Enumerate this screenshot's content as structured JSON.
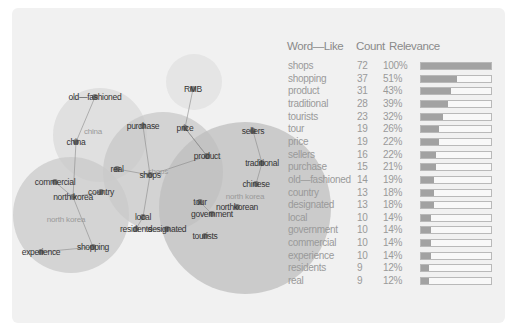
{
  "diagram": {
    "clusters": [
      {
        "id": "china",
        "label": "china",
        "cx": 100,
        "cy": 135,
        "r": 47,
        "color": "#d9d9d9",
        "label_x": 93,
        "label_y": 134
      },
      {
        "id": "rmb",
        "label": "",
        "cx": 194,
        "cy": 82,
        "r": 28,
        "color": "#e0e0e0",
        "label_x": 0,
        "label_y": 0
      },
      {
        "id": "shops",
        "label": "shops",
        "cx": 163,
        "cy": 172,
        "r": 60,
        "color": "#c8c8c8",
        "label_x": 158,
        "label_y": 174
      },
      {
        "id": "north-korea",
        "label": "north korea",
        "cx": 71,
        "cy": 215,
        "r": 58,
        "color": "#c9c9c9",
        "label_x": 66,
        "label_y": 222
      },
      {
        "id": "north-korea-2",
        "label": "north korea",
        "cx": 245,
        "cy": 208,
        "r": 86,
        "color": "#bebebe",
        "label_x": 245,
        "label_y": 199
      }
    ],
    "nodes": [
      {
        "id": "old-fashioned",
        "label": "old—fashioned",
        "x": 95,
        "y": 97
      },
      {
        "id": "china",
        "label": "china",
        "x": 76,
        "y": 142
      },
      {
        "id": "rmb",
        "label": "RMB",
        "x": 193,
        "y": 89
      },
      {
        "id": "purchase",
        "label": "purchase",
        "x": 143,
        "y": 126
      },
      {
        "id": "price",
        "label": "price",
        "x": 185,
        "y": 128
      },
      {
        "id": "product",
        "label": "product",
        "x": 207,
        "y": 156
      },
      {
        "id": "sellers",
        "label": "sellers",
        "x": 253,
        "y": 131
      },
      {
        "id": "traditional",
        "label": "traditional",
        "x": 262,
        "y": 163
      },
      {
        "id": "real",
        "label": "real",
        "x": 117,
        "y": 169
      },
      {
        "id": "shops",
        "label": "shops",
        "x": 150,
        "y": 175
      },
      {
        "id": "commercial",
        "label": "commercial",
        "x": 55,
        "y": 182
      },
      {
        "id": "north-korea",
        "label": "north korea",
        "x": 73,
        "y": 197
      },
      {
        "id": "country",
        "label": "country",
        "x": 101,
        "y": 192
      },
      {
        "id": "chinese",
        "label": "chinese",
        "x": 256,
        "y": 184
      },
      {
        "id": "tour",
        "label": "tour",
        "x": 200,
        "y": 202
      },
      {
        "id": "north-korean",
        "label": "northkorean",
        "x": 237,
        "y": 207
      },
      {
        "id": "government",
        "label": "government",
        "x": 212,
        "y": 214
      },
      {
        "id": "local",
        "label": "local",
        "x": 143,
        "y": 217
      },
      {
        "id": "residents",
        "label": "residents",
        "x": 136,
        "y": 229
      },
      {
        "id": "designated",
        "label": "designated",
        "x": 167,
        "y": 229
      },
      {
        "id": "tourists",
        "label": "tourists",
        "x": 205,
        "y": 236
      },
      {
        "id": "shopping",
        "label": "shopping",
        "x": 93,
        "y": 247
      },
      {
        "id": "experience",
        "label": "experience",
        "x": 41,
        "y": 252
      }
    ],
    "edges": [
      [
        "old-fashioned",
        "china"
      ],
      [
        "china",
        "north-korea"
      ],
      [
        "rmb",
        "price"
      ],
      [
        "price",
        "product"
      ],
      [
        "purchase",
        "shops"
      ],
      [
        "real",
        "shops"
      ],
      [
        "shops",
        "product"
      ],
      [
        "shops",
        "local"
      ],
      [
        "local",
        "residents"
      ],
      [
        "product",
        "price"
      ],
      [
        "sellers",
        "traditional"
      ],
      [
        "traditional",
        "chinese"
      ],
      [
        "commercial",
        "north-korea"
      ],
      [
        "north-korea",
        "country"
      ],
      [
        "north-korea",
        "shopping"
      ],
      [
        "shopping",
        "experience"
      ],
      [
        "tour",
        "government"
      ],
      [
        "residents",
        "designated"
      ]
    ]
  },
  "table": {
    "headers": {
      "word": "Word—Like",
      "count": "Count",
      "relevance": "Relevance"
    },
    "rows": [
      {
        "word": "shops",
        "count": "72",
        "relevance": "100%",
        "pct": 100
      },
      {
        "word": "shopping",
        "count": "37",
        "relevance": "51%",
        "pct": 51
      },
      {
        "word": "product",
        "count": "31",
        "relevance": "43%",
        "pct": 43
      },
      {
        "word": "traditional",
        "count": "28",
        "relevance": "39%",
        "pct": 39
      },
      {
        "word": "tourists",
        "count": "23",
        "relevance": "32%",
        "pct": 32
      },
      {
        "word": "tour",
        "count": "19",
        "relevance": "26%",
        "pct": 26
      },
      {
        "word": "price",
        "count": "19",
        "relevance": "22%",
        "pct": 26
      },
      {
        "word": "sellers",
        "count": "16",
        "relevance": "22%",
        "pct": 22
      },
      {
        "word": "purchase",
        "count": "15",
        "relevance": "21%",
        "pct": 21
      },
      {
        "word": "old—fashioned",
        "count": "14",
        "relevance": "19%",
        "pct": 19
      },
      {
        "word": "country",
        "count": "13",
        "relevance": "18%",
        "pct": 18
      },
      {
        "word": "designated",
        "count": "13",
        "relevance": "18%",
        "pct": 18
      },
      {
        "word": "local",
        "count": "10",
        "relevance": "14%",
        "pct": 14
      },
      {
        "word": "government",
        "count": "10",
        "relevance": "14%",
        "pct": 14
      },
      {
        "word": "commercial",
        "count": "10",
        "relevance": "14%",
        "pct": 14
      },
      {
        "word": "experience",
        "count": "10",
        "relevance": "14%",
        "pct": 14
      },
      {
        "word": "residents",
        "count": "9",
        "relevance": "12%",
        "pct": 12
      },
      {
        "word": "real",
        "count": "9",
        "relevance": "12%",
        "pct": 12
      }
    ]
  },
  "colors": {
    "panel": "#f1f1f1",
    "bar_fill": "#a2a2a2",
    "bar_border": "#b9b9b9",
    "text": "#9a9a9a",
    "node": "#555555"
  }
}
